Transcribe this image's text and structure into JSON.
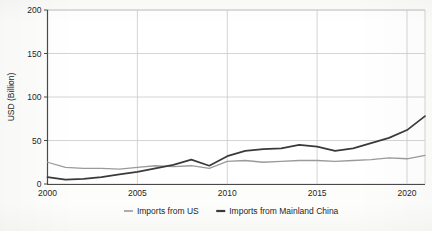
{
  "chart_data": {
    "type": "line",
    "title": "",
    "xlabel": "",
    "ylabel": "USD (Billion)",
    "xlim": [
      2000,
      2021
    ],
    "ylim": [
      0,
      200
    ],
    "grid": true,
    "legend_position": "bottom-center",
    "x": [
      2000,
      2001,
      2002,
      2003,
      2004,
      2005,
      2006,
      2007,
      2008,
      2009,
      2010,
      2011,
      2012,
      2013,
      2014,
      2015,
      2016,
      2017,
      2018,
      2019,
      2020,
      2021
    ],
    "xticks": [
      2000,
      2005,
      2010,
      2015,
      2020
    ],
    "xtick_labels": [
      "2000",
      "2005",
      "2010",
      "2015",
      "2020"
    ],
    "yticks": [
      0,
      50,
      100,
      150,
      200
    ],
    "ytick_labels": [
      "0",
      "50",
      "100",
      "150",
      "200"
    ],
    "series": [
      {
        "name": "Imports from US",
        "color": "#9a9a9a",
        "width": 1.3,
        "values": [
          25,
          19,
          18,
          18,
          17,
          19,
          21,
          20,
          21,
          18,
          26,
          27,
          25,
          26,
          27,
          27,
          26,
          27,
          28,
          30,
          29,
          33
        ]
      },
      {
        "name": "Imports from Mainland China",
        "color": "#3a3a3a",
        "width": 1.7,
        "values": [
          8,
          5,
          6,
          8,
          11,
          14,
          18,
          22,
          28,
          21,
          32,
          38,
          40,
          41,
          45,
          43,
          38,
          41,
          47,
          53,
          62,
          78
        ]
      }
    ]
  },
  "axis": {
    "ylabel": "USD (Billion)"
  },
  "legend": {
    "items": [
      {
        "label": "Imports from US",
        "color": "#9a9a9a",
        "marker": "line-swatch-light"
      },
      {
        "label": "Imports from Mainland China",
        "color": "#3a3a3a",
        "marker": "line-swatch-dark"
      }
    ]
  }
}
